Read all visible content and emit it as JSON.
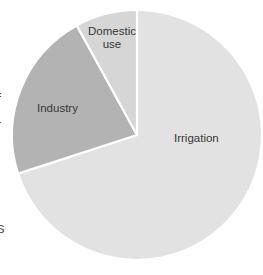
{
  "chart_data": {
    "type": "pie",
    "title": "",
    "categories": [
      "Irrigation",
      "Industry",
      "Domestic use"
    ],
    "values": [
      70,
      22,
      8
    ],
    "unit": "percent (estimated from slice angles; no numbers printed on chart)",
    "slices": [
      {
        "label": "Irrigation",
        "value": 70,
        "color": "#e2e2e2"
      },
      {
        "label": "Industry",
        "value": 22,
        "color": "#b3b3b3"
      },
      {
        "label": "Domestic use",
        "value": 8,
        "color": "#d6d6d6"
      }
    ],
    "start_angle": "12 o'clock",
    "direction": "clockwise",
    "legend": "none, labels placed on slices",
    "separator_color": "#ffffff",
    "label_color": "#383838",
    "background_color": "#ffffff"
  },
  "pie_geometry": {
    "cx": 137,
    "cy": 135,
    "r": 125,
    "gap_stroke_width": 2.2
  },
  "labels": {
    "irrigation": "Irrigation",
    "industry": "Industry",
    "domestic": "Domestic use"
  },
  "edge_fragments": {
    "description": "cut-off characters of adjacent page text at left edge of scan",
    "fragment_1": "f",
    "fragment_2": "-",
    "fragment_3": "s"
  }
}
